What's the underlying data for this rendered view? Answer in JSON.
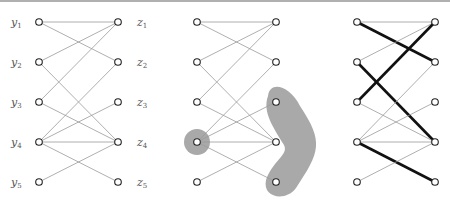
{
  "diagram": {
    "type": "bipartite-graph-figure",
    "panels": 3,
    "left_labels": [
      "y1",
      "y2",
      "y3",
      "y4",
      "y5"
    ],
    "right_labels": [
      "z1",
      "z2",
      "z3",
      "z4",
      "z5"
    ],
    "left_label_parts": [
      [
        "y",
        "1"
      ],
      [
        "y",
        "2"
      ],
      [
        "y",
        "3"
      ],
      [
        "y",
        "4"
      ],
      [
        "y",
        "5"
      ]
    ],
    "right_label_parts": [
      [
        "z",
        "1"
      ],
      [
        "z",
        "2"
      ],
      [
        "z",
        "3"
      ],
      [
        "z",
        "4"
      ],
      [
        "z",
        "5"
      ]
    ],
    "edges": [
      [
        "y1",
        "z1"
      ],
      [
        "y1",
        "z2"
      ],
      [
        "y2",
        "z1"
      ],
      [
        "y2",
        "z4"
      ],
      [
        "y3",
        "z1"
      ],
      [
        "y3",
        "z4"
      ],
      [
        "y4",
        "z2"
      ],
      [
        "y4",
        "z3"
      ],
      [
        "y4",
        "z4"
      ],
      [
        "y4",
        "z5"
      ],
      [
        "y5",
        "z4"
      ]
    ],
    "panel2_highlight": {
      "left_set": [
        "y4"
      ],
      "right_set": [
        "z3",
        "z4",
        "z5"
      ],
      "fill_color": "#a9a9a9"
    },
    "panel3_matching": [
      [
        "y1",
        "z2"
      ],
      [
        "y2",
        "z4"
      ],
      [
        "y3",
        "z1"
      ],
      [
        "y4",
        "z5"
      ]
    ],
    "colors": {
      "edge": "#9a9a9a",
      "bold_edge": "#111111",
      "node_stroke": "#222222",
      "node_fill": "#ffffff",
      "highlight": "#a9a9a9",
      "label": "#555555"
    }
  }
}
